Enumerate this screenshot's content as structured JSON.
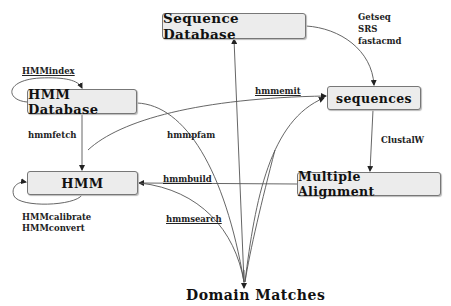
{
  "diagram": {
    "nodes": {
      "sequence_database": "Sequence Database",
      "hmm_database": "HMM Database",
      "sequences": "sequences",
      "hmm": "HMM",
      "multiple_alignment": "Multiple Alignment",
      "domain_matches": "Domain Matches"
    },
    "edge_labels": {
      "hmmindex": "HMMindex",
      "hmmfetch": "hmmfetch",
      "hmmpfam": "hmmpfam",
      "hmmemit": "hmmemit",
      "getseq": "Getseq",
      "srs": "SRS",
      "fastacmd": "fastacmd",
      "clustalw": "ClustalW",
      "hmmbuild": "hmmbuild",
      "hmmsearch": "hmmsearch",
      "hmmcalibrate": "HMMcalibrate",
      "hmmconvert": "HMMconvert"
    },
    "colors": {
      "node_fill": "#ececec",
      "node_border": "#777777",
      "edge": "#444444",
      "text": "#111111"
    }
  }
}
